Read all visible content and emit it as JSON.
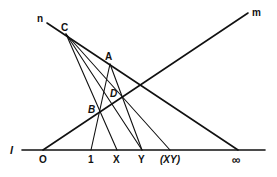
{
  "diagram": {
    "type": "projective-geometry-construction",
    "lines": {
      "l": {
        "label": "l"
      },
      "m": {
        "label": "m"
      },
      "n": {
        "label": "n"
      }
    },
    "points": {
      "C": {
        "label": "C"
      },
      "A": {
        "label": "A"
      },
      "B": {
        "label": "B"
      },
      "D": {
        "label": "D"
      }
    },
    "axis_points": {
      "O": {
        "label": "O"
      },
      "one": {
        "label": "1"
      },
      "X": {
        "label": "X"
      },
      "Y": {
        "label": "Y"
      },
      "XY": {
        "label": "(XY)"
      },
      "infinity": {
        "label": "∞"
      }
    }
  }
}
